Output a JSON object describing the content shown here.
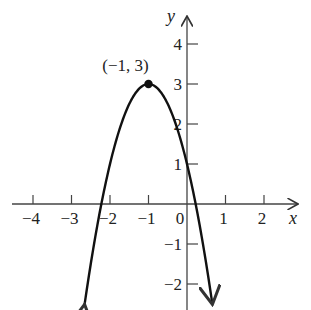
{
  "chart_data": {
    "type": "line",
    "title": "",
    "function": "y = -2(x + 1)^2 + 3",
    "xlabel": "x",
    "ylabel": "y",
    "xlim": [
      -4.4,
      3.1
    ],
    "ylim": [
      -2.5,
      4.6
    ],
    "x_ticks": [
      -4,
      -3,
      -2,
      -1,
      0,
      1,
      2
    ],
    "x_tick_labels": [
      "−4",
      "−3",
      "−2",
      "−1",
      "0",
      "1",
      "2"
    ],
    "y_ticks": [
      4,
      3,
      2,
      1,
      -1,
      -2
    ],
    "y_tick_labels": [
      "4",
      "3",
      "2",
      "1",
      "−1",
      "−2"
    ],
    "grid": false,
    "series": [
      {
        "name": "parabola",
        "x": [
          -2.66,
          -2.22,
          -2,
          -1.5,
          -1,
          -0.5,
          0,
          0.22,
          0.66
        ],
        "y": [
          -2.5,
          0,
          1,
          2.5,
          3,
          2.5,
          1,
          0,
          -2.5
        ]
      }
    ],
    "annotations": [
      {
        "label": "(−1, 3)",
        "x": -1,
        "y": 3,
        "marker": "filled-dot"
      }
    ],
    "curve_ends": "arrows"
  }
}
